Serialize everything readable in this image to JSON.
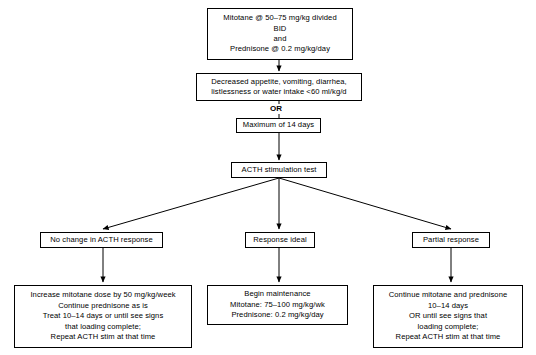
{
  "diagram": {
    "or_label": "OR",
    "nodes": {
      "induction": {
        "name": "induction-protocol",
        "lines": [
          "Mitotane @ 50–75 mg/kg divided",
          "BID",
          "and",
          "Prednisone @ 0.2 mg/kg/day"
        ]
      },
      "signs": {
        "name": "clinical-signs",
        "lines": [
          "Decreased appetite, vomiting, diarrhea,",
          "listlessness or water intake <60 ml/kg/d"
        ]
      },
      "max_days": {
        "name": "maximum-duration",
        "lines": [
          "Maximum of 14 days"
        ]
      },
      "acth_test": {
        "name": "acth-stimulation-test",
        "lines": [
          "ACTH stimulation test"
        ]
      },
      "no_change": {
        "name": "outcome-no-change",
        "lines": [
          "No change in ACTH response"
        ]
      },
      "ideal": {
        "name": "outcome-response-ideal",
        "lines": [
          "Response ideal"
        ]
      },
      "partial": {
        "name": "outcome-partial-response",
        "lines": [
          "Partial response"
        ]
      },
      "no_change_plan": {
        "name": "plan-no-change",
        "lines": [
          "Increase mitotane dose by 50 mg/kg/week",
          "Continue prednisone as is",
          "Treat 10–14 days or until see signs",
          "that loading complete;",
          "Repeat ACTH stim at that time"
        ]
      },
      "ideal_plan": {
        "name": "plan-begin-maintenance",
        "lines": [
          "Begin maintenance",
          "Mitotane: 75–100 mg/kg/wk",
          "Prednisone: 0.2 mg/kg/day"
        ]
      },
      "partial_plan": {
        "name": "plan-partial-response",
        "lines": [
          "Continue mitotane and prednisone",
          "10–14 days",
          "OR until see signs that",
          "loading complete;",
          "Repeat ACTH stim at that time"
        ]
      }
    },
    "colors": {
      "stroke": "#000000",
      "fill": "#ffffff",
      "text": "#000000"
    }
  }
}
